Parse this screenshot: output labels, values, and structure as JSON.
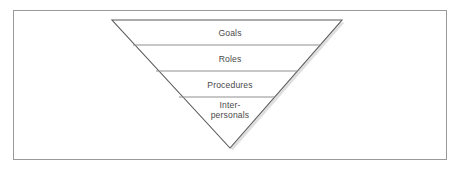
{
  "figure": {
    "type": "inverted-pyramid",
    "frame": {
      "border_color": "#9a9a9a",
      "background_color": "#ffffff"
    },
    "shape": {
      "outline_color": "#5a5a5a",
      "fill_color": "#ffffff",
      "divider_color": "#8f8f8f",
      "shadow_color": "#c8c8c8",
      "apex": {
        "x": 230,
        "y": 148
      },
      "top_left": {
        "x": 112,
        "y": 20
      },
      "top_right": {
        "x": 342,
        "y": 20
      }
    },
    "bands": [
      {
        "label": "Goals",
        "divider_y": 45
      },
      {
        "label": "Roles",
        "divider_y": 71
      },
      {
        "label": "Procedures",
        "divider_y": 97
      },
      {
        "label": "Inter-\npersonals",
        "divider_y": null
      }
    ]
  }
}
